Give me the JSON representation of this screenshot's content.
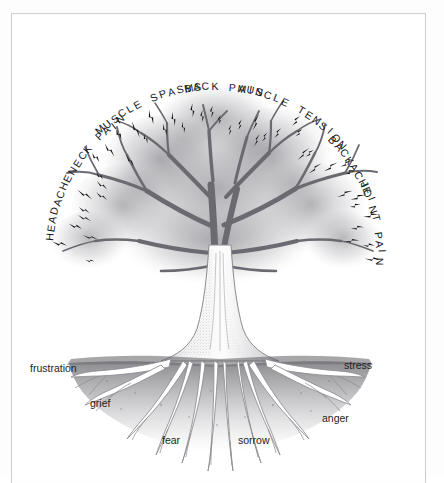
{
  "illustration": {
    "title": "Tree of pain and emotion",
    "style": "graphite pencil drawing, grayscale",
    "background_color": "#ffffff",
    "border_color": "#cfcfcf",
    "ink_color": "#17171a",
    "foliage_color": "#9a9a9e",
    "soil_color": "#8d8d91"
  },
  "canopy_labels": [
    {
      "text": "HEADACHE",
      "angle": -74,
      "radius": 172,
      "name": "label-headache"
    },
    {
      "text": "NECK PAIN",
      "angle": -48,
      "radius": 172,
      "name": "label-neck-pain"
    },
    {
      "text": "MUSCLE SPASMS",
      "angle": -25,
      "radius": 176,
      "name": "label-muscle-spasms"
    },
    {
      "text": "BACK PAIN",
      "angle": 2,
      "radius": 176,
      "name": "label-back-pain"
    },
    {
      "text": "MUSCLE TENSION",
      "angle": 28,
      "radius": 176,
      "name": "label-muscle-tension"
    },
    {
      "text": "BACKACHE",
      "angle": 55,
      "radius": 172,
      "name": "label-backache"
    },
    {
      "text": "JOINT PAIN",
      "angle": 77,
      "radius": 172,
      "name": "label-joint-pain"
    }
  ],
  "root_labels": [
    {
      "text": "frustration",
      "x": 30,
      "y": 362,
      "name": "label-frustration"
    },
    {
      "text": "grief",
      "x": 90,
      "y": 397,
      "name": "label-grief"
    },
    {
      "text": "fear",
      "x": 162,
      "y": 434,
      "name": "label-fear"
    },
    {
      "text": "sorrow",
      "x": 238,
      "y": 434,
      "name": "label-sorrow"
    },
    {
      "text": "anger",
      "x": 322,
      "y": 412,
      "name": "label-anger"
    },
    {
      "text": "stress",
      "x": 344,
      "y": 359,
      "name": "label-stress"
    }
  ],
  "bolts": {
    "name": "pain-bolt-marks",
    "count": 46,
    "description": "small black lightning-bolt marks radiating outward from the canopy"
  },
  "tree": {
    "center_x": 218,
    "canopy_top": 95,
    "ground_line_y": 345,
    "trunk_width": 34
  }
}
